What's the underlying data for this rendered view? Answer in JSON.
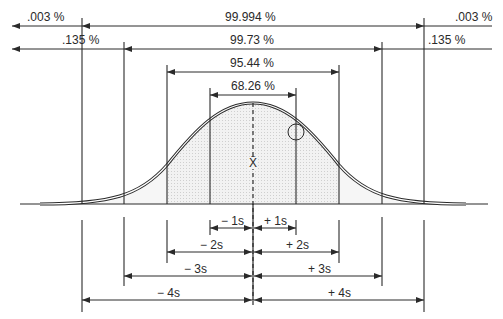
{
  "top_ranges": [
    {
      "label": "99.994 %",
      "coverage": "±4s"
    },
    {
      "label": "99.73 %",
      "coverage": "±3s"
    },
    {
      "label": "95.44 %",
      "coverage": "±2s"
    },
    {
      "label": "68.26 %",
      "coverage": "±1s"
    }
  ],
  "tails": {
    "outer_left": ".003 %",
    "outer_right": ".003 %",
    "inner_left": ".135 %",
    "inner_right": ".135 %"
  },
  "mean_label": "X̄",
  "bottom_intervals": {
    "minus": [
      "− 1s",
      "− 2s",
      "− 3s",
      "− 4s"
    ],
    "plus": [
      "+ 1s",
      "+ 2s",
      "+ 3s",
      "+ 4s"
    ]
  },
  "colors": {
    "line": "#2a2a2a",
    "fill_inner": "#e4e4e4",
    "fill_outer": "#efefef"
  }
}
